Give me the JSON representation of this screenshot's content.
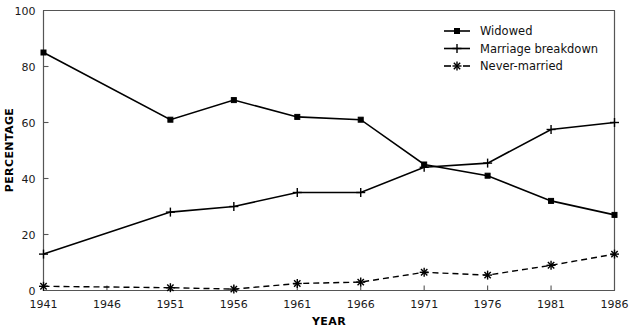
{
  "chart_data": {
    "type": "line",
    "title": "",
    "xlabel": "YEAR",
    "ylabel": "PERCENTAGE",
    "x": [
      1941,
      1946,
      1951,
      1956,
      1961,
      1966,
      1971,
      1976,
      1981,
      1986
    ],
    "xtick_labels": [
      "1941",
      "1946",
      "1951",
      "1956",
      "1961",
      "1966",
      "1971",
      "1976",
      "1981",
      "1986"
    ],
    "ytick_labels": [
      "0",
      "20",
      "40",
      "60",
      "80",
      "100"
    ],
    "yticks": [
      0,
      20,
      40,
      60,
      80,
      100
    ],
    "xlim": [
      1941,
      1986
    ],
    "ylim": [
      0,
      100
    ],
    "grid": false,
    "legend_position": "top-right",
    "series": [
      {
        "name": "Widowed",
        "marker": "square",
        "linestyle": "solid",
        "color": "#000000",
        "x": [
          1941,
          1951,
          1956,
          1961,
          1966,
          1971,
          1976,
          1981,
          1986
        ],
        "values": [
          85,
          61,
          68,
          62,
          61,
          45,
          41,
          32,
          27
        ]
      },
      {
        "name": "Marriage breakdown",
        "marker": "plus",
        "linestyle": "solid",
        "color": "#000000",
        "x": [
          1941,
          1951,
          1956,
          1961,
          1966,
          1971,
          1976,
          1981,
          1986
        ],
        "values": [
          13,
          28,
          30,
          35,
          35,
          44,
          45.5,
          57.5,
          60
        ]
      },
      {
        "name": "Never-married",
        "marker": "star",
        "linestyle": "dashed",
        "color": "#000000",
        "x": [
          1941,
          1951,
          1956,
          1961,
          1966,
          1971,
          1976,
          1981,
          1986
        ],
        "values": [
          1.5,
          1,
          0.5,
          2.5,
          3,
          6.5,
          5.5,
          9,
          13
        ]
      }
    ]
  },
  "legend": {
    "items": [
      {
        "label": "Widowed"
      },
      {
        "label": "Marriage breakdown"
      },
      {
        "label": "Never-married"
      }
    ]
  },
  "axes": {
    "x_title": "YEAR",
    "y_title": "PERCENTAGE"
  }
}
